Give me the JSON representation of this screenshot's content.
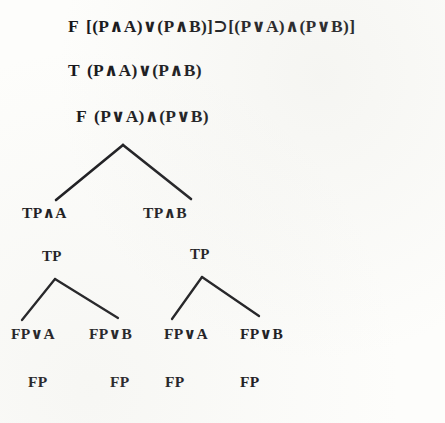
{
  "page": {
    "kind": "logic-proof-tree",
    "ink_color": "#18181c",
    "paper_color": "#fdfdfb"
  },
  "header_lines": [
    {
      "id": "line-1",
      "sign": "F",
      "formula": "[(P∧A)∨(P∧B)]⊃[(P∨A)∧(P∨B)]",
      "x": 68,
      "y": 18
    },
    {
      "id": "line-2",
      "sign": "T",
      "formula": "(P∧A)∨(P∧B)",
      "x": 68,
      "y": 62
    },
    {
      "id": "line-3",
      "sign": "F",
      "formula": "(P∨A)∧(P∨B)",
      "x": 76,
      "y": 108
    }
  ],
  "tree_nodes": [
    {
      "id": "node-tpa",
      "label": "TP∧A",
      "x": 22,
      "y": 205,
      "size": "normal"
    },
    {
      "id": "node-tpb",
      "label": "TP∧B",
      "x": 143,
      "y": 205,
      "size": "normal"
    },
    {
      "id": "node-tp-1",
      "label": "TP",
      "x": 42,
      "y": 249,
      "size": "small"
    },
    {
      "id": "node-tp-2",
      "label": "TP",
      "x": 190,
      "y": 247,
      "size": "small"
    },
    {
      "id": "node-fpa-1",
      "label": "FP∨A",
      "x": 11,
      "y": 326,
      "size": "normal"
    },
    {
      "id": "node-fpb-1",
      "label": "FP∨B",
      "x": 89,
      "y": 326,
      "size": "normal"
    },
    {
      "id": "node-fpa-2",
      "label": "FP∨A",
      "x": 164,
      "y": 326,
      "size": "normal"
    },
    {
      "id": "node-fpb-2",
      "label": "FP∨B",
      "x": 240,
      "y": 326,
      "size": "normal"
    },
    {
      "id": "node-fp-1",
      "label": "FP",
      "x": 28,
      "y": 374,
      "size": "normal"
    },
    {
      "id": "node-fp-2",
      "label": "FP",
      "x": 110,
      "y": 374,
      "size": "normal"
    },
    {
      "id": "node-fp-3",
      "label": "FP",
      "x": 165,
      "y": 374,
      "size": "normal"
    },
    {
      "id": "node-fp-4",
      "label": "FP",
      "x": 240,
      "y": 374,
      "size": "normal"
    }
  ],
  "branches": [
    {
      "id": "branch-root-left",
      "x1": 123,
      "y1": 145,
      "x2": 56,
      "y2": 200,
      "w": 2.6
    },
    {
      "id": "branch-root-right",
      "x1": 123,
      "y1": 145,
      "x2": 191,
      "y2": 199,
      "w": 2.6
    },
    {
      "id": "branch-left-left",
      "x1": 55,
      "y1": 279,
      "x2": 22,
      "y2": 320,
      "w": 2.3
    },
    {
      "id": "branch-left-right",
      "x1": 55,
      "y1": 279,
      "x2": 118,
      "y2": 318,
      "w": 2.3
    },
    {
      "id": "branch-right-left",
      "x1": 202,
      "y1": 277,
      "x2": 172,
      "y2": 319,
      "w": 2.3
    },
    {
      "id": "branch-right-right",
      "x1": 202,
      "y1": 277,
      "x2": 259,
      "y2": 316,
      "w": 2.3
    }
  ]
}
